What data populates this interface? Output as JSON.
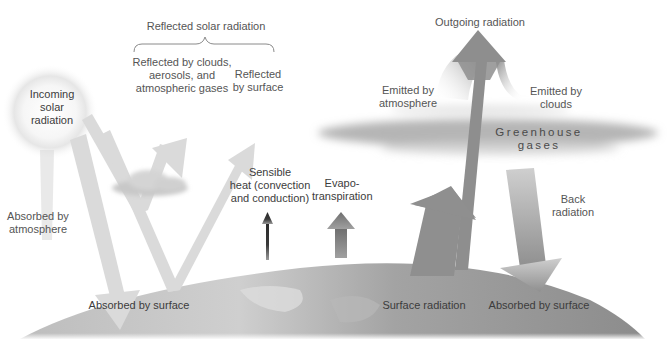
{
  "diagram": {
    "colors": {
      "background": "#ffffff",
      "text": "#555555",
      "solar_arrows": "#d9d9d9",
      "heat_arrows": "#8a8a8a",
      "sensible_heat_arrow": "#2e2e2e",
      "earth_surface": "#9a9a9a",
      "greenhouse_band": "#a8a8a8",
      "sun_glow": "#eeeeee"
    },
    "labels": {
      "reflected_solar": "Reflected solar radiation",
      "reflected_clouds": "Reflected by clouds,\naerosols, and\natmospheric gases",
      "reflected_surface": "Reflected\nby surface",
      "incoming_solar": "Incoming\nsolar\nradiation",
      "absorbed_atmosphere": "Absorbed by\natmosphere",
      "absorbed_surface_left": "Absorbed by surface",
      "sensible_heat": "Sensible\nheat (convection\nand conduction)",
      "evapotranspiration": "Evapo-\ntranspiration",
      "outgoing_radiation": "Outgoing radiation",
      "emitted_atmosphere": "Emitted by\natmosphere",
      "emitted_clouds": "Emitted by\nclouds",
      "greenhouse_gases": "Greenhouse gases",
      "back_radiation": "Back\nradiation",
      "surface_radiation": "Surface radiation",
      "absorbed_surface_right": "Absorbed by surface"
    }
  }
}
